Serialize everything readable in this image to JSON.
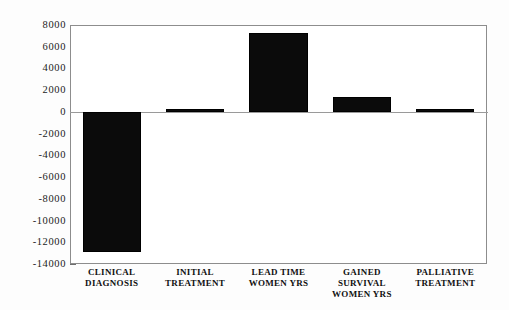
{
  "chart_data": {
    "type": "bar",
    "title": "",
    "subtitle": "",
    "xlabel": "",
    "ylabel": "",
    "categories": [
      "CLINICAL\nDIAGNOSIS",
      "INITIAL\nTREATMENT",
      "LEAD TIME\nWOMEN YRS",
      "GAINED\nSURVIVAL\nWOMEN YRS",
      "PALLIATIVE\nTREATMENT"
    ],
    "values": [
      -12900,
      280,
      7270,
      1400,
      280
    ],
    "ylim": [
      -14000,
      8000
    ],
    "ytick_step": 2000,
    "ytick_labels": [
      "8000",
      "6000",
      "4000",
      "2000",
      "0",
      "-2000",
      "-4000",
      "-6000",
      "-8000",
      "-10000",
      "-12000",
      "-14000"
    ],
    "ytick_values": [
      8000,
      6000,
      4000,
      2000,
      0,
      -2000,
      -4000,
      -6000,
      -8000,
      -10000,
      -12000,
      -14000
    ],
    "grid": false,
    "legend": false,
    "legend_position": "none",
    "bar_color": "#0b0b0b",
    "frame_color": "#8d8d8d",
    "background_color": "#ffffff"
  }
}
